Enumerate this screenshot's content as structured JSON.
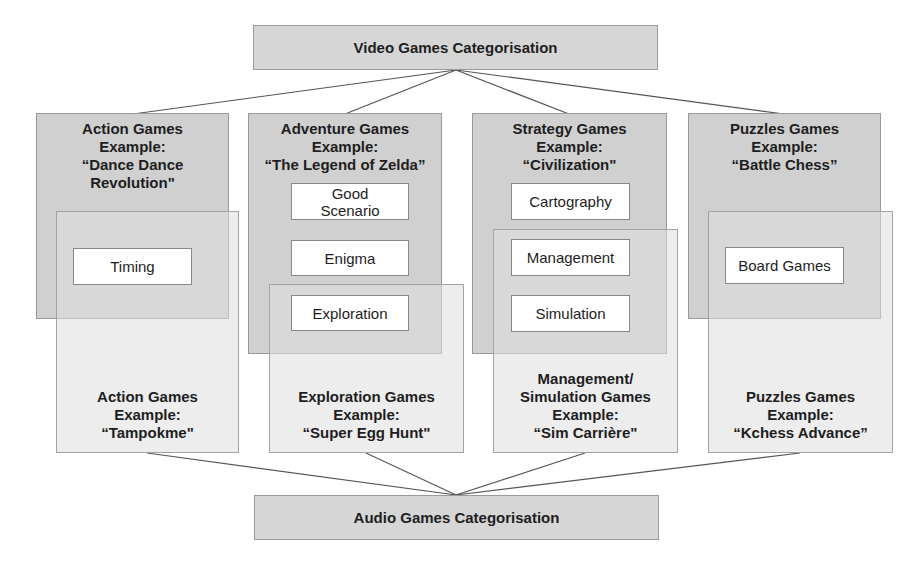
{
  "top_node": {
    "label": "Video Games Categorisation"
  },
  "bottom_node": {
    "label": "Audio Games Categorisation"
  },
  "video_categories": [
    {
      "title": "Action Games",
      "example_label": "Example:",
      "example": "“Dance Dance Revolution\"",
      "example_line1": "“Dance Dance",
      "example_line2": "Revolution\""
    },
    {
      "title": "Adventure Games",
      "example_label": "Example:",
      "example": "“The Legend of Zelda”"
    },
    {
      "title": "Strategy Games",
      "example_label": "Example:",
      "example": "“Civilization\""
    },
    {
      "title": "Puzzles Games",
      "example_label": "Example:",
      "example": "“Battle Chess”"
    }
  ],
  "audio_categories": [
    {
      "title": "Action Games",
      "example_label": "Example:",
      "example": "“Tampokme\""
    },
    {
      "title": "Exploration Games",
      "example_label": "Example:",
      "example": "“Super Egg Hunt\""
    },
    {
      "title_line1": "Management/",
      "title_line2": "Simulation Games",
      "title": "Management/ Simulation Games",
      "example_label": "Example:",
      "example": "“Sim Carrière\""
    },
    {
      "title": "Puzzles Games",
      "example_label": "Example:",
      "example": "“Kchess Advance”"
    }
  ],
  "features": {
    "timing": "Timing",
    "good_scenario_line1": "Good",
    "good_scenario_line2": "Scenario",
    "enigma": "Enigma",
    "exploration": "Exploration",
    "cartography": "Cartography",
    "management": "Management",
    "simulation": "Simulation",
    "board_games": "Board Games"
  }
}
